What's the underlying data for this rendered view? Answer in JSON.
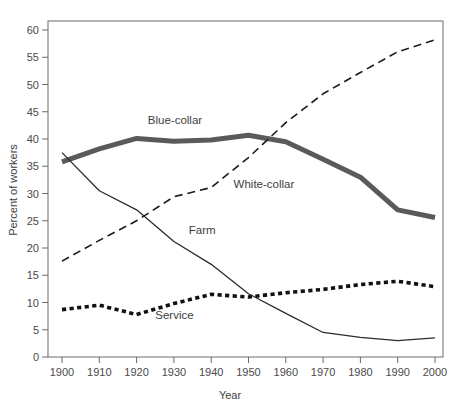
{
  "chart_data": {
    "type": "line",
    "title": "",
    "xlabel": "Year",
    "ylabel": "Percent of workers",
    "xlim": [
      1900,
      2000
    ],
    "ylim": [
      0,
      62
    ],
    "ytick_step": 5,
    "grid": false,
    "legend_position": "inline-annotations",
    "x": [
      1900,
      1910,
      1920,
      1930,
      1940,
      1950,
      1960,
      1970,
      1980,
      1990,
      2000
    ],
    "xticklabels": [
      "1900",
      "1910",
      "1920",
      "1930",
      "1940",
      "1950",
      "1960",
      "1970",
      "1980",
      "1990",
      "2000"
    ],
    "yticklabels": [
      "0",
      "5",
      "10",
      "15",
      "20",
      "25",
      "30",
      "35",
      "40",
      "45",
      "50",
      "55",
      "60"
    ],
    "series": [
      {
        "name": "Blue-collar",
        "style": "thick-solid-gray",
        "color": "#5a5a5a",
        "width": 5,
        "values": [
          35.8,
          38.2,
          40.1,
          39.6,
          39.8,
          40.7,
          39.5,
          36.3,
          33.0,
          27.0,
          25.6
        ]
      },
      {
        "name": "White-collar",
        "style": "dashed",
        "color": "#1a1a1a",
        "width": 1.6,
        "values": [
          17.6,
          21.4,
          25.0,
          29.4,
          31.1,
          36.6,
          43.0,
          48.3,
          52.2,
          56.0,
          58.2
        ]
      },
      {
        "name": "Farm",
        "style": "thin-solid",
        "color": "#2b2b2b",
        "width": 1.3,
        "values": [
          37.5,
          30.5,
          27.0,
          21.2,
          17.0,
          11.6,
          8.0,
          4.5,
          3.6,
          3.0,
          3.5
        ]
      },
      {
        "name": "Service",
        "style": "dotted",
        "color": "#111111",
        "width": 3.6,
        "values": [
          8.7,
          9.5,
          7.8,
          9.8,
          11.5,
          11.0,
          11.8,
          12.4,
          13.3,
          13.9,
          12.9
        ]
      }
    ],
    "annotations": [
      {
        "text": "Blue-collar",
        "x": 1923,
        "y": 42.8
      },
      {
        "text": "White-collar",
        "x": 1946,
        "y": 31.0
      },
      {
        "text": "Farm",
        "x": 1934,
        "y": 22.6
      },
      {
        "text": "Service",
        "x": 1925,
        "y": 6.9
      }
    ]
  }
}
